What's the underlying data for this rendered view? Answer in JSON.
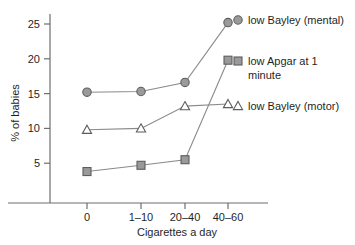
{
  "chart_data": {
    "type": "line",
    "title": "",
    "xlabel": "Cigarettes a day",
    "ylabel": "% of babies",
    "categories": [
      "0",
      "1–10",
      "20–40",
      "40–60"
    ],
    "yticks": [
      5,
      10,
      15,
      20,
      25
    ],
    "ylim": [
      0,
      27
    ],
    "grid": false,
    "legend_position": "right-inline",
    "series": [
      {
        "name": "low Bayley (mental)",
        "marker": "circle",
        "color": "#9a9a9a",
        "values": [
          15.2,
          15.3,
          16.6,
          25.2
        ]
      },
      {
        "name": "low Apgar at 1 minute",
        "marker": "square",
        "color": "#9a9a9a",
        "values": [
          3.8,
          4.7,
          5.5,
          19.8
        ]
      },
      {
        "name": "low Bayley (motor)",
        "marker": "triangle",
        "color": "#ffffff",
        "values": [
          9.8,
          10.0,
          13.2,
          13.5
        ]
      }
    ]
  },
  "axes": {
    "y_title": "% of babies",
    "x_title": "Cigarettes a day",
    "y_tick_labels": [
      "5",
      "10",
      "15",
      "20",
      "25"
    ],
    "x_tick_labels": [
      "0",
      "1–10",
      "20–40",
      "40–60"
    ]
  },
  "legend": {
    "items": [
      {
        "marker_name": "circle-marker",
        "line1": "low Bayley (mental)",
        "line2": ""
      },
      {
        "marker_name": "square-marker",
        "line1": "low Apgar at 1",
        "line2": "minute"
      },
      {
        "marker_name": "triangle-marker",
        "line1": "low Bayley (motor)",
        "line2": ""
      }
    ]
  },
  "colors": {
    "marker_fill": "#9a9a9a",
    "marker_stroke": "#5d5d5d",
    "line": "#8a8a8a",
    "axis": "#6e6e6e",
    "text": "#1f1f1f",
    "background": "#ffffff"
  }
}
